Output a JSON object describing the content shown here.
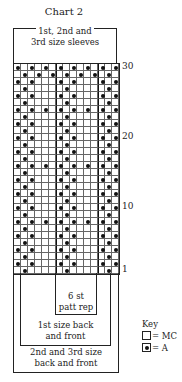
{
  "title": "Chart 2",
  "top_bracket_label_line1": "1st, 2nd and",
  "top_bracket_label_line2": "3rd size sleeves",
  "row_labels": [
    {
      "row": 30,
      "text": "30"
    },
    {
      "row": 20,
      "text": "20"
    },
    {
      "row": 10,
      "text": "10"
    },
    {
      "row": 1,
      "text": "1"
    }
  ],
  "columns": 15,
  "rows": 30,
  "pattern_rows_top_to_bottom": [
    "A.A.A.A.A.A.A.A",
    ".A.A.A.A.A.A.A.",
    "A.A...A.A...A.A",
    ".A.....A.....A.",
    "A.A...A.A...A.A",
    ".A.....A.....A.",
    "A.A.A.A.A.A.A.A",
    ".A.....A.....A.",
    "A.A...A.A...A.A",
    ".A.....A.....A.",
    "A.A...A.A...A.A",
    ".A.....A.....A.",
    "A.A...A.A...A.A",
    ".A.....A.....A.",
    "A.A.A.A.A.A.A.A",
    ".A.....A.....A.",
    "A.A...A.A...A.A",
    ".A.....A.....A.",
    "A.A...A.A...A.A",
    ".A.....A.....A.",
    "A.A...A.A...A.A",
    ".A.....A.....A.",
    "A.A.A.A.A.A.A.A",
    ".A.....A.....A.",
    "A.A...A.A...A.A",
    ".A.....A.....A.",
    "A.A...A.A...A.A",
    ".A.....A.....A.",
    "A.A...A.A...A.A",
    ".A.....A.....A."
  ],
  "brackets": {
    "patt_rep_line1": "6 st",
    "patt_rep_line2": "patt rep",
    "first_size_line1": "1st size back",
    "first_size_line2": "and front",
    "other_sizes_line1": "2nd and 3rd size",
    "other_sizes_line2": "back and front"
  },
  "key": {
    "title": "Key",
    "mc_label": "= MC",
    "a_label": "= A"
  }
}
